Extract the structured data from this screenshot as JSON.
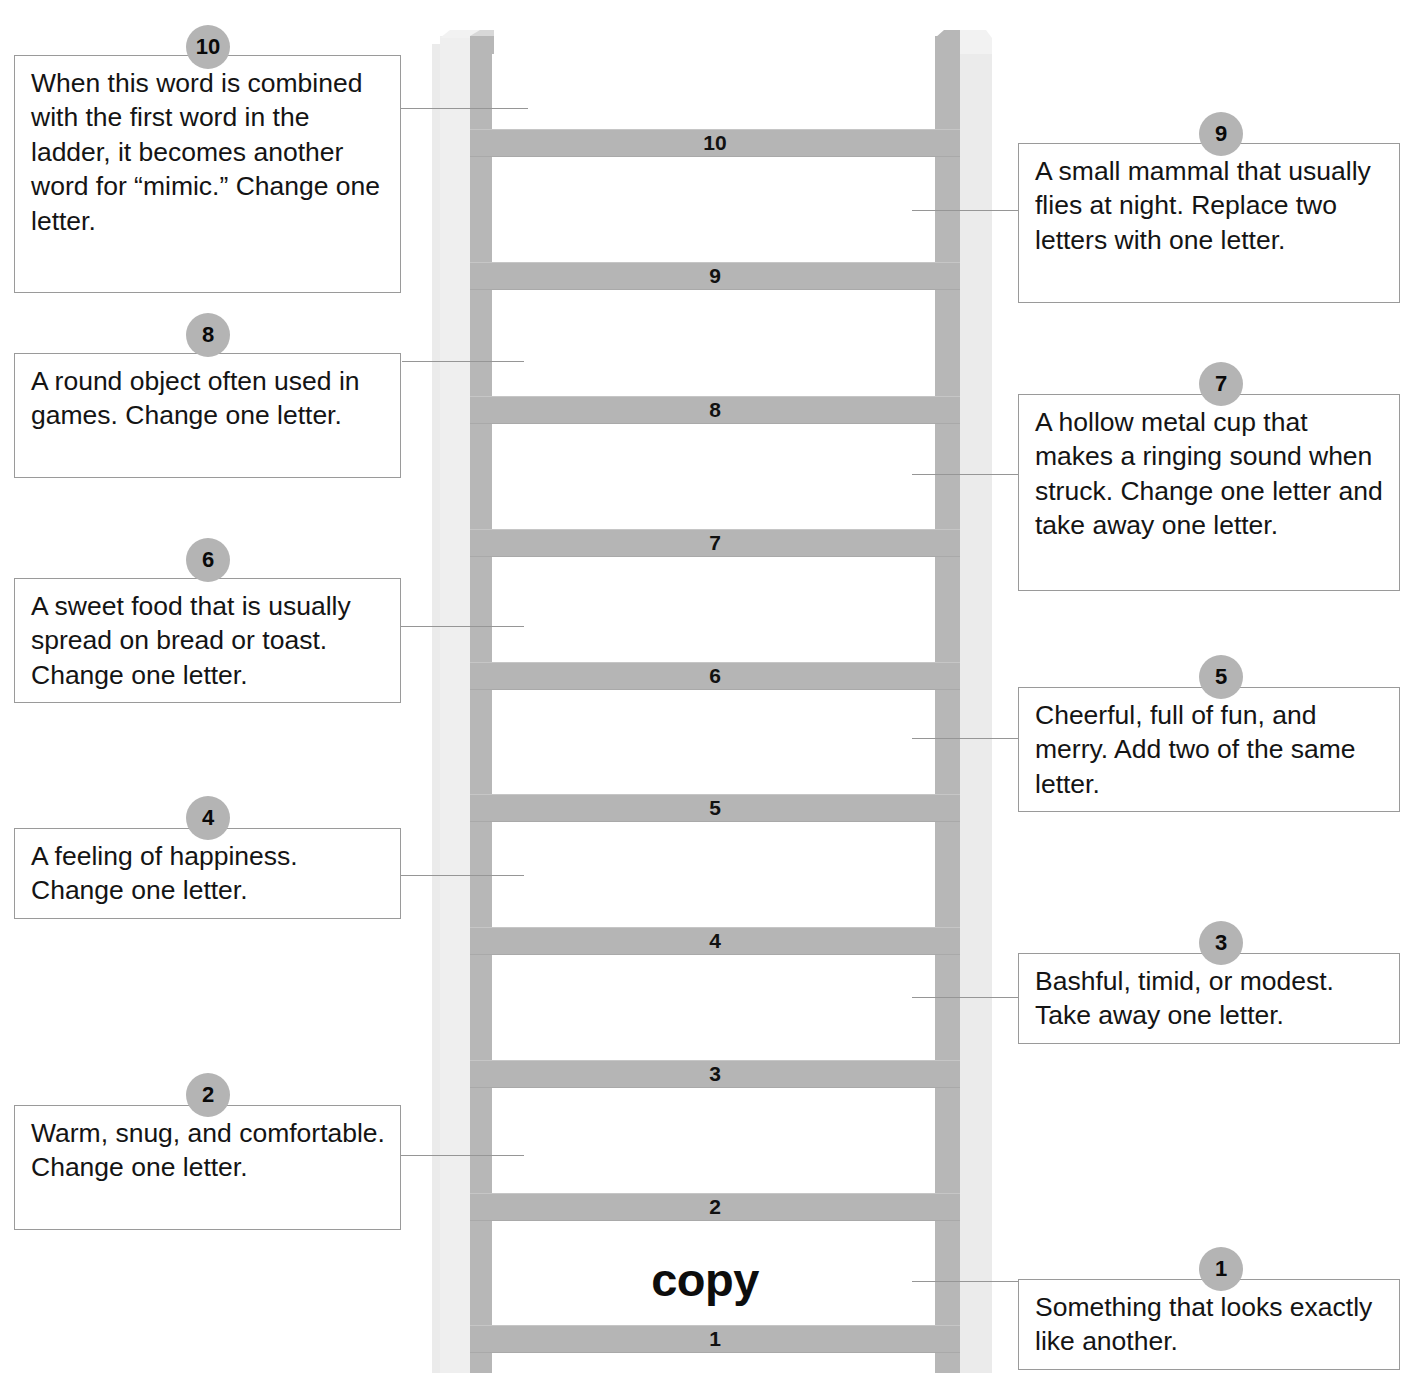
{
  "puzzle": {
    "type": "word-ladder",
    "start_word": "copy",
    "total_steps": 10,
    "rung_labels": [
      "1",
      "2",
      "3",
      "4",
      "5",
      "6",
      "7",
      "8",
      "9",
      "10"
    ]
  },
  "colors": {
    "rung": "#b5b5b5",
    "rail": "#b7b7b7",
    "rail_face": "#efefef",
    "badge": "#b4b4b4",
    "box_border": "#9a9a9a",
    "text": "#141414"
  },
  "clues": [
    {
      "number": "10",
      "side": "left",
      "text": "When this word is combined with the first word in the ladder, it becomes another word for “mimic.”  Change one letter."
    },
    {
      "number": "9",
      "side": "right",
      "text": "A small mammal that usually flies at night. Replace two letters with one letter."
    },
    {
      "number": "8",
      "side": "left",
      "text": "A round object often used in games.  Change one letter."
    },
    {
      "number": "7",
      "side": "right",
      "text": "A hollow metal cup that makes a ringing sound when struck.  Change one letter and take away one letter."
    },
    {
      "number": "6",
      "side": "left",
      "text": "A sweet food that is usually spread on bread or toast.  Change one letter."
    },
    {
      "number": "5",
      "side": "right",
      "text": "Cheerful, full of fun, and merry.  Add two of the same letter."
    },
    {
      "number": "4",
      "side": "left",
      "text": "A feeling of happiness. Change one letter."
    },
    {
      "number": "3",
      "side": "right",
      "text": "Bashful, timid, or modest. Take away one letter."
    },
    {
      "number": "2",
      "side": "left",
      "text": "Warm, snug, and comfortable.  Change one letter."
    },
    {
      "number": "1",
      "side": "right",
      "text": "Something that looks exactly like another."
    }
  ]
}
